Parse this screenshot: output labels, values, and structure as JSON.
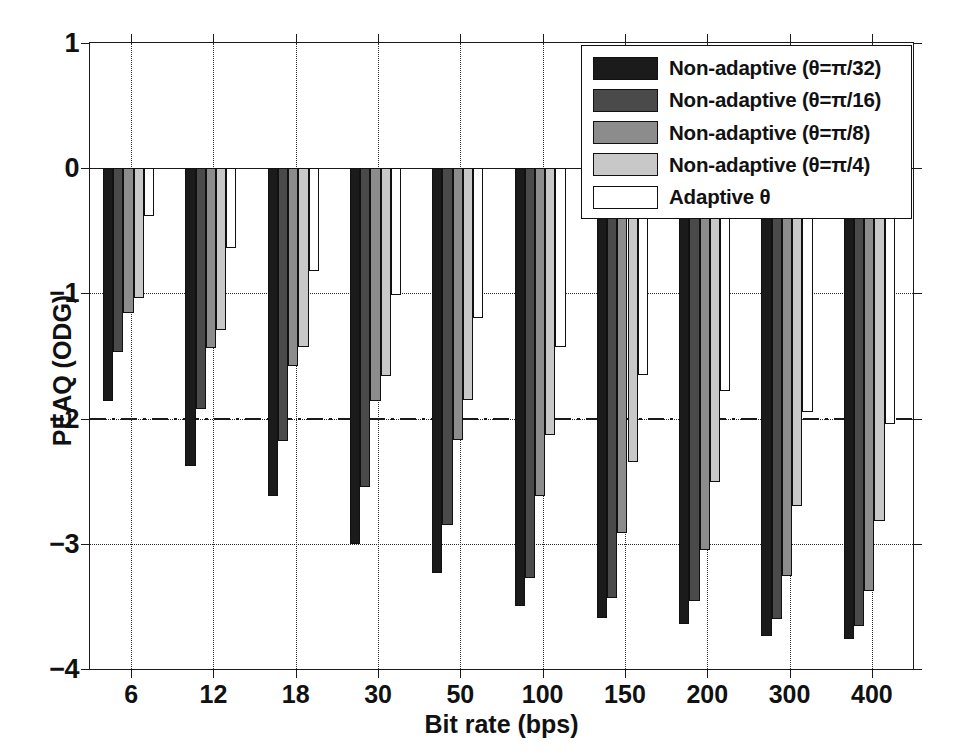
{
  "chart_data": {
    "type": "bar",
    "title": "",
    "xlabel": "Bit rate (bps)",
    "ylabel": "PEAQ (ODG)",
    "categories": [
      "6",
      "12",
      "18",
      "30",
      "50",
      "100",
      "150",
      "200",
      "300",
      "400"
    ],
    "ylim": [
      -4,
      1
    ],
    "yticks": [
      "1",
      "0",
      "-1",
      "-2",
      "-3",
      "-4"
    ],
    "ytick_values": [
      1,
      0,
      -1,
      -2,
      -3,
      -4
    ],
    "grid": "dotted-both-axes",
    "reference_line": -2,
    "reference_line_style": "dash-dot",
    "legend_position": "top-right",
    "series": [
      {
        "name": "Non-adaptive (θ=π/32)",
        "color": "#1b1b1b",
        "values": [
          -1.86,
          -2.38,
          -2.62,
          -3.0,
          -3.23,
          -3.5,
          -3.59,
          -3.64,
          -3.74,
          -3.76
        ]
      },
      {
        "name": "Non-adaptive (θ=π/16)",
        "color": "#4a4a4a",
        "values": [
          -1.47,
          -1.92,
          -2.18,
          -2.55,
          -2.85,
          -3.27,
          -3.43,
          -3.46,
          -3.6,
          -3.66
        ]
      },
      {
        "name": "Non-adaptive (θ=π/8)",
        "color": "#8c8c8c",
        "values": [
          -1.16,
          -1.44,
          -1.58,
          -1.86,
          -2.17,
          -2.62,
          -2.91,
          -3.05,
          -3.26,
          -3.38
        ]
      },
      {
        "name": "Non-adaptive (θ=π/4)",
        "color": "#c8c8c8",
        "values": [
          -1.04,
          -1.29,
          -1.43,
          -1.66,
          -1.85,
          -2.13,
          -2.35,
          -2.51,
          -2.7,
          -2.82
        ]
      },
      {
        "name": "Adaptive θ",
        "color": "#ffffff",
        "values": [
          -0.38,
          -0.64,
          -0.82,
          -1.01,
          -1.2,
          -1.43,
          -1.65,
          -1.78,
          -1.95,
          -2.04
        ]
      }
    ]
  },
  "axes": {
    "x_title": "Bit rate (bps)",
    "y_title": "PEAQ (ODG)"
  }
}
